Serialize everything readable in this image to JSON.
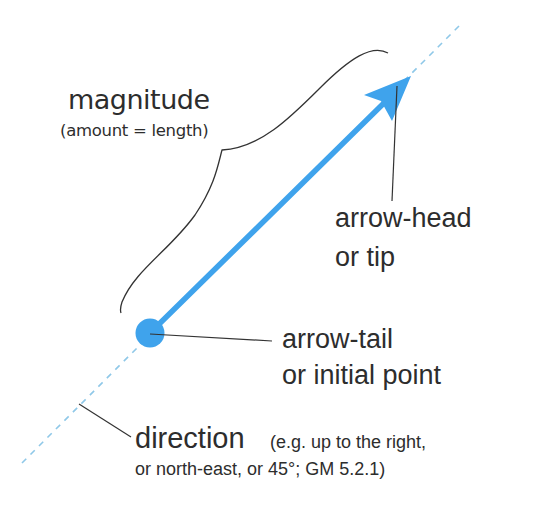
{
  "diagram": {
    "colors": {
      "vector": "#3fa3ec",
      "dashed_line": "#8fc8e8",
      "ink": "#2d2d2d",
      "background": "#ffffff"
    },
    "labels": {
      "magnitude": {
        "title": "magnitude",
        "subtitle": "(amount = length)"
      },
      "arrow_head": {
        "line1": "arrow-head",
        "line2": "or tip"
      },
      "arrow_tail": {
        "line1": "arrow-tail",
        "line2": "or initial point"
      },
      "direction": {
        "title": "direction",
        "note_line1": "(e.g. up to the right,",
        "note_line2": "or north-east, or 45°; GM 5.2.1)"
      }
    },
    "elements": [
      {
        "name": "vector-arrow",
        "from": [
          150,
          333
        ],
        "to": [
          410,
          77
        ]
      },
      {
        "name": "line-of-action",
        "style": "dashed",
        "from": [
          22,
          463
        ],
        "to": [
          460,
          25
        ]
      },
      {
        "name": "magnitude-brace",
        "spans": "tail to head"
      },
      {
        "name": "tail-point",
        "shape": "circle",
        "center": [
          150,
          333
        ],
        "radius": 14
      }
    ]
  }
}
